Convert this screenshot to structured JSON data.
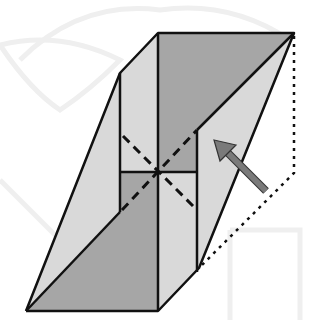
{
  "diagram": {
    "title": "Origami fold step: reverse fold along diagonal",
    "colors": {
      "background": "#ffffff",
      "watermark": "#eeeeee",
      "paper_light": "#d9d9d9",
      "paper_dark": "#a6a6a6",
      "outline": "#111111",
      "arrow": "#7a7a7a",
      "dash": "#111111"
    },
    "elements": [
      "outline-shape",
      "dark-top-face",
      "dark-bottom-face",
      "crease-cross-dashed",
      "fold-arrow",
      "dotted-fold-hint"
    ]
  }
}
